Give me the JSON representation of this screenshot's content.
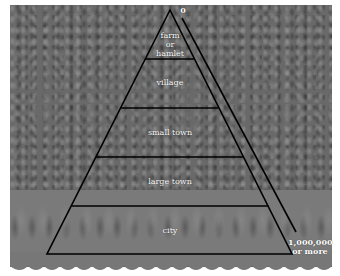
{
  "diagram": {
    "type": "settlement-hierarchy-pyramid",
    "tiers": [
      {
        "label_lines": [
          "farm",
          "or",
          "hamlet"
        ]
      },
      {
        "label": "village"
      },
      {
        "label": "small town"
      },
      {
        "label": "large town"
      },
      {
        "label": "city"
      }
    ],
    "scale": {
      "top_label": "0",
      "bottom_label_lines": [
        "1,000,000",
        "or more"
      ]
    },
    "colors": {
      "lines": "#000000",
      "labels": "#ffffff",
      "background": "#6a6a6a"
    }
  }
}
